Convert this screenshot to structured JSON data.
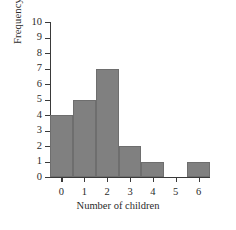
{
  "chart_data": {
    "type": "bar",
    "title": "",
    "subtitle": "",
    "xlabel": "Number of children",
    "ylabel": "Frequency",
    "categories": [
      "0",
      "1",
      "2",
      "3",
      "4",
      "5",
      "6"
    ],
    "values": [
      4,
      5,
      7,
      2,
      1,
      0,
      1
    ],
    "xtick_labels": [
      "0",
      "1",
      "2",
      "3",
      "4",
      "5",
      "6"
    ],
    "ytick_labels": [
      "0",
      "1",
      "2",
      "3",
      "4",
      "5",
      "6",
      "7",
      "8",
      "9",
      "10"
    ],
    "ytick_values": [
      0,
      1,
      2,
      3,
      4,
      5,
      6,
      7,
      8,
      9,
      10
    ],
    "ylim": [
      0,
      10
    ],
    "xlim": [
      -0.5,
      6.5
    ],
    "grid": false,
    "legend": false,
    "legend_position": "none",
    "annotations": [],
    "colors": {
      "bar_fill": "#808080",
      "bar_edge": "#6e6e6e",
      "axis": "#3a3a3a",
      "text": "#2b2b2b",
      "background": "#ffffff"
    }
  }
}
